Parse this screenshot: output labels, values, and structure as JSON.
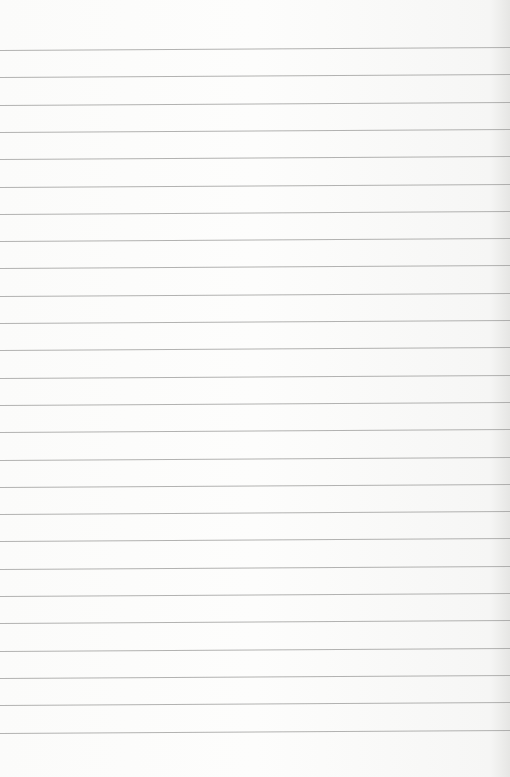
{
  "paper": {
    "type": "lined-paper",
    "line_count": 26,
    "first_line_y": 50,
    "line_spacing": 27.3,
    "line_color": "#9a9a98",
    "background_color": "#fbfbfa"
  }
}
